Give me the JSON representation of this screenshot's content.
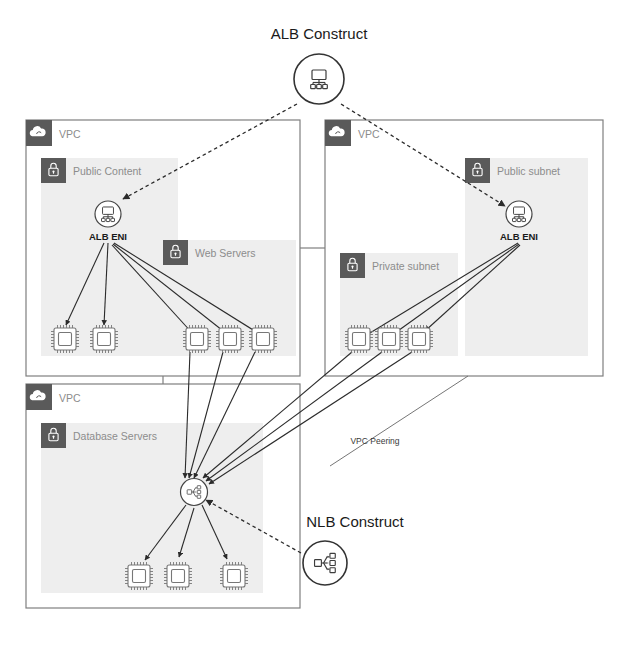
{
  "diagram": {
    "title": "ALB Construct",
    "background_color": "#ffffff",
    "accent_color": "#5a5a5a",
    "subnet_fill": "#eeeeee"
  },
  "constructs": {
    "alb": {
      "label": "ALB Construct",
      "icon": "load-balancer-icon"
    },
    "nlb": {
      "label": "NLB Construct",
      "icon": "network-load-balancer-icon"
    }
  },
  "vpcs": [
    {
      "id": "vpc-left",
      "label": "VPC",
      "icon": "vpc-cloud-icon",
      "subnets": [
        {
          "id": "public-content",
          "label": "Public Content",
          "icon": "lock-icon",
          "nodes": [
            {
              "type": "eni",
              "label": "ALB ENI",
              "icon": "alb-eni-icon"
            },
            {
              "type": "ec2",
              "label": "",
              "icon": "ec2-instance-icon"
            },
            {
              "type": "ec2",
              "label": "",
              "icon": "ec2-instance-icon"
            }
          ]
        },
        {
          "id": "web-servers",
          "label": "Web Servers",
          "icon": "lock-icon",
          "nodes": [
            {
              "type": "ec2",
              "label": "",
              "icon": "ec2-instance-icon"
            },
            {
              "type": "ec2",
              "label": "",
              "icon": "ec2-instance-icon"
            },
            {
              "type": "ec2",
              "label": "",
              "icon": "ec2-instance-icon"
            }
          ]
        }
      ]
    },
    {
      "id": "vpc-right",
      "label": "VPC",
      "icon": "vpc-cloud-icon",
      "subnets": [
        {
          "id": "public-subnet",
          "label": "Public subnet",
          "icon": "lock-icon",
          "nodes": [
            {
              "type": "eni",
              "label": "ALB ENI",
              "icon": "alb-eni-icon"
            }
          ]
        },
        {
          "id": "private-subnet",
          "label": "Private subnet",
          "icon": "lock-icon",
          "nodes": [
            {
              "type": "ec2",
              "label": "",
              "icon": "ec2-instance-icon"
            },
            {
              "type": "ec2",
              "label": "",
              "icon": "ec2-instance-icon"
            },
            {
              "type": "ec2",
              "label": "",
              "icon": "ec2-instance-icon"
            }
          ]
        }
      ]
    },
    {
      "id": "vpc-bottom",
      "label": "VPC",
      "icon": "vpc-cloud-icon",
      "subnets": [
        {
          "id": "database-servers",
          "label": "Database Servers",
          "icon": "lock-icon",
          "nodes": [
            {
              "type": "eni",
              "label": "",
              "icon": "nlb-eni-icon"
            },
            {
              "type": "ec2",
              "label": "",
              "icon": "ec2-instance-icon"
            },
            {
              "type": "ec2",
              "label": "",
              "icon": "ec2-instance-icon"
            },
            {
              "type": "ec2",
              "label": "",
              "icon": "ec2-instance-icon"
            }
          ]
        }
      ]
    }
  ],
  "annotations": [
    {
      "id": "vpc-peering",
      "label": "VPC Peering"
    }
  ],
  "labels": {
    "alb_eni_left": "ALB ENI",
    "alb_eni_right": "ALB ENI",
    "vpc_left": "VPC",
    "vpc_right": "VPC",
    "vpc_bottom": "VPC",
    "public_content": "Public Content",
    "web_servers": "Web Servers",
    "public_subnet": "Public subnet",
    "private_subnet": "Private subnet",
    "database_servers": "Database Servers",
    "vpc_peering": "VPC Peering",
    "alb_construct": "ALB Construct",
    "nlb_construct": "NLB Construct"
  }
}
